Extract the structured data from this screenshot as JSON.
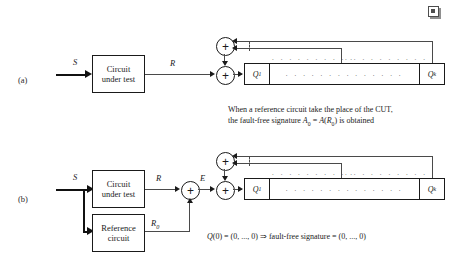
{
  "figure": {
    "corner_icon": "square-placeholder-icon",
    "panels": [
      {
        "id": "a",
        "label": "(a)",
        "blocks": [
          {
            "name": "circuit-under-test",
            "line1": "Circuit",
            "line2": "under test"
          }
        ],
        "signals": {
          "input": "S",
          "response": "R"
        },
        "register": {
          "first_cell": "Q",
          "first_cell_sub": "1",
          "last_cell": "Q",
          "last_cell_sub": "k",
          "middle_dots": ". . . . . . . . . . . . . .",
          "tap_dots_left": ". . . . . . . . . .",
          "tap_dots_right": ". . . . . . . . . ."
        },
        "xor_symbol": "+",
        "caption": [
          "When a reference circuit take the place of the CUT,",
          "the fault-free signature A0 = A(R0) is obtained"
        ],
        "caption_line2_parts": {
          "prefix": "the fault-free signature ",
          "a_sym": "A",
          "a_sub": "0",
          "eq": " = ",
          "func": "A",
          "open": "(",
          "r_sym": "R",
          "r_sub": "0",
          "close": ")",
          "suffix": " is obtained"
        }
      },
      {
        "id": "b",
        "label": "(b)",
        "blocks": [
          {
            "name": "circuit-under-test",
            "line1": "Circuit",
            "line2": "under test"
          },
          {
            "name": "reference-circuit",
            "line1": "Reference",
            "line2": "circuit"
          }
        ],
        "signals": {
          "input": "S",
          "response": "R",
          "reference_response": "R",
          "reference_response_sub": "0",
          "error": "E"
        },
        "register": {
          "first_cell": "Q",
          "first_cell_sub": "1",
          "last_cell": "Q",
          "last_cell_sub": "k",
          "middle_dots": ". . . . . . . . . . . . . .",
          "tap_dots_left": ". . . . . . . . . .",
          "tap_dots_right": ". . . . . . . . . ."
        },
        "xor_symbol": "+",
        "caption_parts": {
          "q_sym": "Q",
          "q_args": "(0) = (0, ..., 0) ",
          "implies": "⇒",
          "tail": " fault-free signature = (0, ..., 0)"
        }
      }
    ]
  }
}
